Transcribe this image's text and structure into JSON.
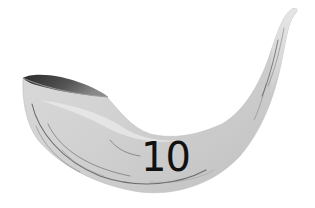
{
  "illustration": {
    "subject": "shofar-horn",
    "label": "10",
    "colors": {
      "horn_fill": "#d4d4d4",
      "horn_highlight": "#ececec",
      "horn_shadow": "#a8a8a8",
      "mouth_interior": "#3a3a3a",
      "streak": "#5a5a5a",
      "label_text": "#111111",
      "background": "#ffffff"
    }
  }
}
